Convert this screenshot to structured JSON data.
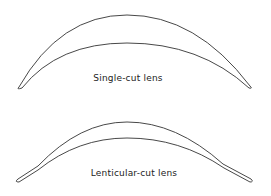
{
  "diagram": {
    "figures": [
      {
        "id": "single-cut",
        "label": "Single-cut lens"
      },
      {
        "id": "lenticular-cut",
        "label": "Lenticular-cut lens"
      }
    ],
    "colors": {
      "stroke": "#333333",
      "background": "#ffffff",
      "text": "#222222"
    }
  }
}
